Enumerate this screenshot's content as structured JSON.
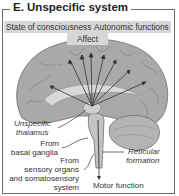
{
  "title": "E. Unspecific system",
  "top_labels": {
    "left": "State of consciousness",
    "right": "Autonomic functions",
    "center": "Affect"
  },
  "annotations": {
    "unspecific_thalamus_1": "Unspecific",
    "unspecific_thalamus_2": "thalamus",
    "basal_ganglia_1": "From",
    "basal_ganglia_2": "basal ganglia",
    "sensory_1": "From",
    "sensory_2": "sensory organs",
    "sensory_3": "and somatosensory",
    "sensory_4": "system",
    "reticular_1": "Reticular",
    "reticular_2": "formation",
    "motor": "Motor function"
  },
  "colors": {
    "brain": "#a9a9a9",
    "brain_dark": "#8c8c8c",
    "label_bg": "#d7d7d7",
    "frame": "#6b6b6b"
  }
}
